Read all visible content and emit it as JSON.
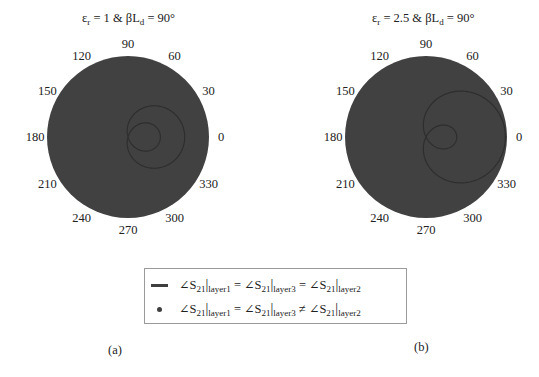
{
  "chart_data": [
    {
      "type": "polar",
      "panel": "(a)",
      "title": "εr = 1 & βLd = 90°",
      "title_parts": {
        "eps": "ε",
        "eps_sub": "r",
        "rest1": " = 1 & βL",
        "ld_sub": "d",
        "rest2": " = 90°"
      },
      "angular_ticks": [
        "0",
        "30",
        "60",
        "90",
        "120",
        "150",
        "180",
        "210",
        "240",
        "270",
        "300",
        "330"
      ],
      "disc_color": "#414141",
      "curve_color": "#333333",
      "series": [
        {
          "name": "∠S21|layer1 = ∠S21|layer3 = ∠S21|layer2",
          "style": "line",
          "shape": "limacon with inner loop",
          "a": 0.15,
          "b": 0.55
        },
        {
          "name": "∠S21|layer1 = ∠S21|layer3 ≠ ∠S21|layer2",
          "style": "dot",
          "fill": "full disc (radius 1)"
        }
      ]
    },
    {
      "type": "polar",
      "panel": "(b)",
      "title": "εr = 2.5 & βLd = 90°",
      "title_parts": {
        "eps": "ε",
        "eps_sub": "r",
        "rest1": " = 2.5 & βL",
        "ld_sub": "d",
        "rest2": " = 90°"
      },
      "angular_ticks": [
        "0",
        "30",
        "60",
        "90",
        "120",
        "150",
        "180",
        "210",
        "240",
        "270",
        "300",
        "330"
      ],
      "disc_color": "#414141",
      "curve_color": "#333333",
      "series": [
        {
          "name": "∠S21|layer1 = ∠S21|layer3 = ∠S21|layer2",
          "style": "line",
          "shape": "limacon with inner loop",
          "a": 0.3,
          "b": 0.68
        },
        {
          "name": "∠S21|layer1 = ∠S21|layer3 ≠ ∠S21|layer2",
          "style": "dot",
          "fill": "full disc (radius 1)"
        }
      ]
    }
  ],
  "legend": {
    "items": [
      {
        "marker": "line",
        "parts": [
          "∠S",
          "21",
          "|",
          "layer1",
          " = ∠S",
          "21",
          "|",
          "layer3",
          " = ∠S",
          "21",
          "|",
          "layer2"
        ]
      },
      {
        "marker": "dot",
        "parts": [
          "∠S",
          "21",
          "|",
          "layer1",
          " = ∠S",
          "21",
          "|",
          "layer3",
          " ≠ ∠S",
          "21",
          "|",
          "layer2"
        ]
      }
    ]
  },
  "captions": {
    "a": "(a)",
    "b": "(b)"
  }
}
